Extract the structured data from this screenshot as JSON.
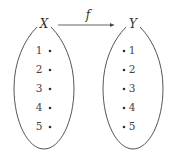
{
  "diagram": {
    "type": "function-mapping",
    "function_label": "f",
    "domain_set": {
      "label": "X",
      "elements": [
        "1",
        "2",
        "3",
        "4",
        "5"
      ]
    },
    "codomain_set": {
      "label": "Y",
      "elements": [
        "1",
        "2",
        "3",
        "4",
        "5"
      ]
    },
    "arrow": {
      "from": "X",
      "to": "Y"
    },
    "colors": {
      "stroke": "#555555",
      "text": "#333333",
      "background": "#ffffff"
    }
  }
}
